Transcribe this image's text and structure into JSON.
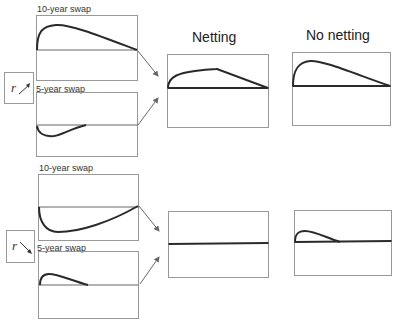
{
  "columns": {
    "netting_title": "Netting",
    "no_netting_title": "No netting"
  },
  "scenarios": [
    {
      "rate_direction_symbol": "r",
      "rate_direction": "up",
      "ten_year_label": "10-year swap",
      "five_year_label": "5-year swap",
      "ten_year_profile": "positive hump, rises quickly then declines to zero at maturity",
      "five_year_profile": "negative dip, returns to zero around mid-horizon",
      "netting_profile": "positive, rises then declines to zero",
      "no_netting_profile": "positive hump (same as 10-year swap exposure)"
    },
    {
      "rate_direction_symbol": "r",
      "rate_direction": "down",
      "ten_year_label": "10-year swap",
      "five_year_label": "5-year swap",
      "ten_year_profile": "negative dip then rising toward zero at maturity",
      "five_year_profile": "small positive hump ending around mid-horizon",
      "netting_profile": "flat at zero",
      "no_netting_profile": "small positive hump (5-year swap exposure only)"
    }
  ],
  "colors": {
    "curve": "#2a2a2a",
    "axis": "#555555",
    "frame": "#999999",
    "arrow": "#666666"
  }
}
